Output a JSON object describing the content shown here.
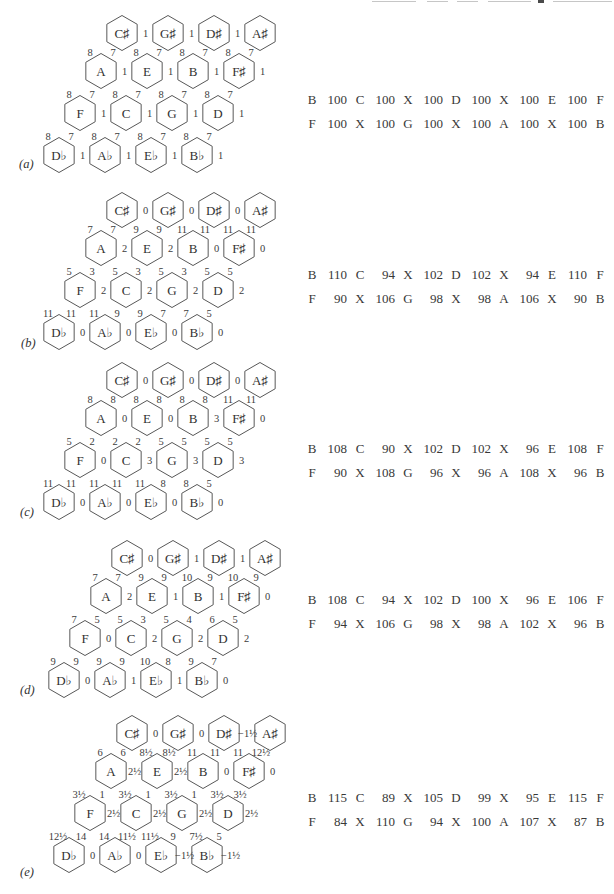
{
  "artifacts": {
    "top_edge": "illegible clipped text line"
  },
  "figure": {
    "panels": [
      {
        "id": "a",
        "label": "(a)",
        "lattice": {
          "rows": [
            {
              "notes": [
                "C♯",
                "G♯",
                "D♯",
                "A♯"
              ],
              "right": [
                "1",
                "1",
                "1",
                null
              ],
              "top": null
            },
            {
              "notes": [
                "A",
                "E",
                "B",
                "F♯"
              ],
              "right": [
                "1",
                "1",
                "1",
                "1"
              ],
              "top": [
                [
                  "8",
                  "7"
                ],
                [
                  "8",
                  "7"
                ],
                [
                  "8",
                  "7"
                ],
                [
                  "8",
                  "7"
                ]
              ]
            },
            {
              "notes": [
                "F",
                "C",
                "G",
                "D"
              ],
              "right": [
                "1",
                "1",
                "1",
                "1"
              ],
              "top": [
                [
                  "8",
                  "7"
                ],
                [
                  "8",
                  "7"
                ],
                [
                  "8",
                  "7"
                ],
                [
                  "8",
                  "7"
                ]
              ]
            },
            {
              "notes": [
                "D♭",
                "A♭",
                "E♭",
                "B♭"
              ],
              "right": [
                "1",
                "1",
                "1",
                "1"
              ],
              "top": [
                [
                  "8",
                  "7"
                ],
                [
                  "8",
                  "7"
                ],
                [
                  "8",
                  "7"
                ],
                [
                  "8",
                  "7"
                ]
              ]
            }
          ]
        },
        "table": {
          "row1": [
            "B",
            "100",
            "C",
            "100",
            "X",
            "100",
            "D",
            "100",
            "X",
            "100",
            "E",
            "100",
            "F"
          ],
          "row2": [
            "F",
            "100",
            "X",
            "100",
            "G",
            "100",
            "X",
            "100",
            "A",
            "100",
            "X",
            "100",
            "B"
          ]
        }
      },
      {
        "id": "b",
        "label": "(b)",
        "lattice": {
          "rows": [
            {
              "notes": [
                "C♯",
                "G♯",
                "D♯",
                "A♯"
              ],
              "right": [
                "0",
                "0",
                "0",
                null
              ],
              "top": null
            },
            {
              "notes": [
                "A",
                "E",
                "B",
                "F♯"
              ],
              "right": [
                "2",
                "2",
                "0",
                "0"
              ],
              "top": [
                [
                  "7",
                  "7"
                ],
                [
                  "9",
                  "9"
                ],
                [
                  "11",
                  "11"
                ],
                [
                  "11",
                  "11"
                ]
              ]
            },
            {
              "notes": [
                "F",
                "C",
                "G",
                "D"
              ],
              "right": [
                "2",
                "2",
                "2",
                "2"
              ],
              "top": [
                [
                  "5",
                  "3"
                ],
                [
                  "5",
                  "3"
                ],
                [
                  "5",
                  "3"
                ],
                [
                  "5",
                  "5"
                ]
              ]
            },
            {
              "notes": [
                "D♭",
                "A♭",
                "E♭",
                "B♭"
              ],
              "right": [
                "0",
                "0",
                "0",
                "0"
              ],
              "top": [
                [
                  "11",
                  "11"
                ],
                [
                  "11",
                  "9"
                ],
                [
                  "9",
                  "7"
                ],
                [
                  "7",
                  "5"
                ]
              ]
            }
          ]
        },
        "table": {
          "row1": [
            "B",
            "110",
            "C",
            "94",
            "X",
            "102",
            "D",
            "102",
            "X",
            "94",
            "E",
            "110",
            "F"
          ],
          "row2": [
            "F",
            "90",
            "X",
            "106",
            "G",
            "98",
            "X",
            "98",
            "A",
            "106",
            "X",
            "90",
            "B"
          ]
        }
      },
      {
        "id": "c",
        "label": "(c)",
        "lattice": {
          "rows": [
            {
              "notes": [
                "C♯",
                "G♯",
                "D♯",
                "A♯"
              ],
              "right": [
                "0",
                "0",
                "0",
                null
              ],
              "top": null
            },
            {
              "notes": [
                "A",
                "E",
                "B",
                "F♯"
              ],
              "right": [
                "0",
                "0",
                "3",
                "0"
              ],
              "top": [
                [
                  "8",
                  "8"
                ],
                [
                  "8",
                  "8"
                ],
                [
                  "8",
                  "8"
                ],
                [
                  "11",
                  "11"
                ]
              ]
            },
            {
              "notes": [
                "F",
                "C",
                "G",
                "D"
              ],
              "right": [
                "0",
                "3",
                "3",
                "3"
              ],
              "top": [
                [
                  "5",
                  "2"
                ],
                [
                  "2",
                  "2"
                ],
                [
                  "5",
                  "5"
                ],
                [
                  "5",
                  "5"
                ]
              ]
            },
            {
              "notes": [
                "D♭",
                "A♭",
                "E♭",
                "B♭"
              ],
              "right": [
                "0",
                "0",
                "0",
                "0"
              ],
              "top": [
                [
                  "11",
                  "11"
                ],
                [
                  "11",
                  "11"
                ],
                [
                  "11",
                  "8"
                ],
                [
                  "8",
                  "5"
                ]
              ]
            }
          ]
        },
        "table": {
          "row1": [
            "B",
            "108",
            "C",
            "90",
            "X",
            "102",
            "D",
            "102",
            "X",
            "96",
            "E",
            "108",
            "F"
          ],
          "row2": [
            "F",
            "90",
            "X",
            "108",
            "G",
            "96",
            "X",
            "96",
            "A",
            "108",
            "X",
            "96",
            "B"
          ]
        }
      },
      {
        "id": "d",
        "label": "(d)",
        "lattice": {
          "rows": [
            {
              "notes": [
                "C♯",
                "G♯",
                "D♯",
                "A♯"
              ],
              "right": [
                "0",
                "1",
                "1",
                null
              ],
              "top": null
            },
            {
              "notes": [
                "A",
                "E",
                "B",
                "F♯"
              ],
              "right": [
                "2",
                "1",
                "1",
                "0"
              ],
              "top": [
                [
                  "7",
                  "7"
                ],
                [
                  "9",
                  "9"
                ],
                [
                  "10",
                  "9"
                ],
                [
                  "10",
                  "9"
                ]
              ]
            },
            {
              "notes": [
                "F",
                "C",
                "G",
                "D"
              ],
              "right": [
                "0",
                "2",
                "2",
                "2"
              ],
              "top": [
                [
                  "7",
                  "5"
                ],
                [
                  "5",
                  "3"
                ],
                [
                  "5",
                  "4"
                ],
                [
                  "6",
                  "5"
                ]
              ]
            },
            {
              "notes": [
                "D♭",
                "A♭",
                "E♭",
                "B♭"
              ],
              "right": [
                "0",
                "1",
                "1",
                "0"
              ],
              "top": [
                [
                  "9",
                  "9"
                ],
                [
                  "9",
                  "9"
                ],
                [
                  "10",
                  "8"
                ],
                [
                  "9",
                  "7"
                ]
              ]
            }
          ]
        },
        "table": {
          "row1": [
            "B",
            "108",
            "C",
            "94",
            "X",
            "102",
            "D",
            "100",
            "X",
            "96",
            "E",
            "106",
            "F"
          ],
          "row2": [
            "F",
            "94",
            "X",
            "106",
            "G",
            "98",
            "X",
            "98",
            "A",
            "102",
            "X",
            "96",
            "B"
          ]
        }
      },
      {
        "id": "e",
        "label": "(e)",
        "lattice": {
          "rows": [
            {
              "notes": [
                "C♯",
                "G♯",
                "D♯",
                "A♯"
              ],
              "right": [
                "0",
                "0",
                "−1½",
                null
              ],
              "top": null
            },
            {
              "notes": [
                "A",
                "E",
                "B",
                "F♯"
              ],
              "right": [
                "2½",
                "2½",
                "0",
                "0"
              ],
              "top": [
                [
                  "6",
                  "6"
                ],
                [
                  "8½",
                  "8½"
                ],
                [
                  "11",
                  "11"
                ],
                [
                  "11",
                  "12½"
                ]
              ]
            },
            {
              "notes": [
                "F",
                "C",
                "G",
                "D"
              ],
              "right": [
                "2½",
                "2½",
                "2½",
                "2½"
              ],
              "top": [
                [
                  "3½",
                  "1"
                ],
                [
                  "3½",
                  "1"
                ],
                [
                  "3½",
                  "1"
                ],
                [
                  "3½",
                  "3½"
                ]
              ]
            },
            {
              "notes": [
                "D♭",
                "A♭",
                "E♭",
                "B♭"
              ],
              "right": [
                "0",
                "0",
                "−1½",
                "−1½"
              ],
              "top": [
                [
                  "12½",
                  "14"
                ],
                [
                  "14",
                  "11½"
                ],
                [
                  "11½",
                  "9"
                ],
                [
                  "7½",
                  "5"
                ]
              ]
            }
          ]
        },
        "table": {
          "row1": [
            "B",
            "115",
            "C",
            "89",
            "X",
            "105",
            "D",
            "99",
            "X",
            "95",
            "E",
            "115",
            "F"
          ],
          "row2": [
            "F",
            "84",
            "X",
            "110",
            "G",
            "94",
            "X",
            "100",
            "A",
            "107",
            "X",
            "87",
            "B"
          ]
        }
      }
    ]
  }
}
